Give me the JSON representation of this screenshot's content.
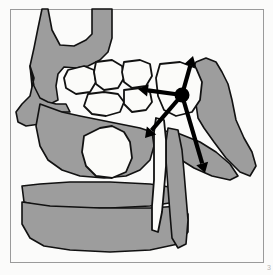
{
  "figure": {
    "caption_number": "3",
    "title": "Sagittal section of skull showing paranasal sinuses and force vectors",
    "frame": {
      "border_color": "#9a9a9a",
      "border_width": 1,
      "inset_left": 10,
      "inset_top": 9,
      "inset_right": 263,
      "inset_bottom": 262,
      "background_color": "#fbfbfa"
    },
    "palette": {
      "bone_fill": "#9d9d9d",
      "cavity_fill": "#fbfbf9",
      "outline": "#111111",
      "arrow_color": "#000000",
      "page_number_color": "#b4b4b4"
    },
    "structures": [
      {
        "name": "frontal-and-nasal-bone-mass",
        "label": "Frontal / nasal bone mass",
        "fill": "bone_fill",
        "points": "42,9 48,9 52,30 60,45 74,46 86,40 92,34 92,9 112,9 112,38 108,52 100,60 88,66 76,68 64,67 58,74 56,86 58,100 50,104 40,100 32,86 30,66 34,48 38,28"
      },
      {
        "name": "nasal-dorsum-lower-process",
        "label": "Nasal dorsum lower process",
        "fill": "bone_fill",
        "points": "30,66 34,78 30,96 22,104 16,112 18,122 26,126 40,124 52,118 62,112 70,112 66,104 56,104 48,102 40,98 34,86"
      },
      {
        "name": "maxilla-body",
        "label": "Maxillary body",
        "fill": "bone_fill",
        "points": "40,104 62,112 80,116 100,120 120,124 140,128 152,132 154,146 150,160 140,170 126,176 104,178 80,176 62,170 48,160 40,146 36,126"
      },
      {
        "name": "maxillary-alveolar-plate",
        "label": "Maxillary alveolar plate",
        "fill": "bone_fill",
        "points": "22,186 40,184 70,182 110,182 150,184 176,188 176,202 150,206 110,208 70,208 40,206 24,202"
      },
      {
        "name": "mandible-ramus-body",
        "label": "Mandible body and symphysis",
        "fill": "bone_fill",
        "points": "22,202 50,206 100,208 150,208 180,206 188,214 188,232 178,244 150,250 110,252 70,250 44,246 30,238 22,224"
      },
      {
        "name": "sphenoid-pterygoid-mass",
        "label": "Sphenoid and pterygoid plate mass",
        "fill": "bone_fill",
        "points": "196,62 206,58 216,62 222,72 228,84 232,100 236,120 244,138 252,152 256,166 250,176 240,172 226,158 214,142 204,128 198,118 196,104 192,88 190,74"
      },
      {
        "name": "pterygoid-hamulus-wing",
        "label": "Pterygoid wing / hamulus",
        "fill": "bone_fill",
        "points": "160,130 180,134 200,142 216,152 230,164 238,176 230,180 212,176 194,168 178,158 166,148 158,140"
      },
      {
        "name": "posterior-pharyngeal-column",
        "label": "Posterior pharyngeal bony column",
        "fill": "bone_fill",
        "points": "168,128 178,130 182,150 184,172 186,196 188,220 186,244 178,248 172,238 170,214 168,188 166,160 166,142"
      }
    ],
    "air_cells": [
      {
        "name": "ethmoid-cell-1",
        "label": "Anterior ethmoid air cell",
        "points": "68,70 84,66 94,70 96,82 90,92 76,94 66,88 64,78"
      },
      {
        "name": "ethmoid-cell-2",
        "label": "Middle ethmoid air cell",
        "points": "96,62 112,60 122,66 124,78 118,88 104,90 96,84 94,72"
      },
      {
        "name": "ethmoid-cell-3",
        "label": "Superior ethmoid air cell",
        "points": "124,62 140,60 150,64 152,76 146,86 132,88 124,82 122,72"
      },
      {
        "name": "ethmoid-cell-4",
        "label": "Posterior ethmoid air cell",
        "points": "88,94 104,92 118,94 124,102 120,112 106,116 92,114 84,106"
      },
      {
        "name": "ethmoid-cell-5",
        "label": "Inferior ethmoid recess",
        "points": "124,90 140,88 150,92 152,102 146,110 132,112 124,104"
      },
      {
        "name": "sphenoid-sinus",
        "label": "Sphenoid sinus",
        "points": "160,64 180,62 196,68 202,82 200,100 192,112 176,116 164,110 158,96 156,78"
      },
      {
        "name": "oral-cavity-space",
        "label": "Oral / tongue cavity space",
        "points": "84,136 100,128 112,126 124,132 130,142 132,158 126,172 112,178 96,176 86,166 82,152"
      },
      {
        "name": "nasopharynx-channel",
        "label": "Nasopharyngeal channel",
        "points": "156,118 164,120 166,140 166,166 164,190 162,212 158,232 152,230 152,206 154,180 154,152 154,132"
      }
    ],
    "force_arrows": {
      "hub": {
        "name": "force-origin-hub",
        "label": "Force application point",
        "cx": 182,
        "cy": 95,
        "r": 7.5
      },
      "vectors": [
        {
          "name": "arrow-superior",
          "label": "Superior vector",
          "x1": 182,
          "y1": 95,
          "x2": 193,
          "y2": 56,
          "head": 10,
          "width": 4.2
        },
        {
          "name": "arrow-anterior",
          "label": "Anterior vector",
          "x1": 182,
          "y1": 95,
          "x2": 138,
          "y2": 89,
          "head": 10,
          "width": 4.2
        },
        {
          "name": "arrow-antero-inferior",
          "label": "Antero-inferior vector",
          "x1": 182,
          "y1": 95,
          "x2": 145,
          "y2": 138,
          "head": 10,
          "width": 4.2
        },
        {
          "name": "arrow-postero-inferior",
          "label": "Postero-inferior vector",
          "x1": 182,
          "y1": 95,
          "x2": 205,
          "y2": 173,
          "head": 10,
          "width": 4.2
        }
      ]
    }
  }
}
